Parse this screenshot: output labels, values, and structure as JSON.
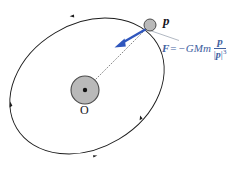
{
  "figure": {
    "background_color": "#ffffff"
  },
  "colors": {
    "orbit_stroke": "#1c1c1c",
    "central_body_fill": "#b9b9b9",
    "central_body_stroke": "#4a4a4a",
    "orbiting_body_fill": "#b9b9b9",
    "orbiting_body_stroke": "#4a4a4a",
    "force_arrow": "#2f56bd",
    "equation_text": "#41619f",
    "leader_line": "#8f9aa8",
    "radius_line": "#6b6b6b",
    "label_text": "#15151b"
  },
  "labels": {
    "orbiting_body": "p",
    "origin": "O"
  },
  "equation": {
    "force_symbol": "F",
    "equals": "=",
    "minus": "−",
    "constants": "GMm",
    "numerator": "p",
    "denominator_open": "|",
    "denominator_vector": "p",
    "denominator_close": "|",
    "denominator_exponent": "3",
    "full_text": "F = −GMm p/|p|³"
  },
  "geometry": {
    "orbit": {
      "shape": "ellipse",
      "center_x": 87,
      "center_y": 86,
      "radius_x": 82,
      "radius_y": 62,
      "rotation_deg": -31
    },
    "central_body": {
      "center_x": 85,
      "center_y": 90,
      "radius": 14,
      "core_dot_radius": 2.2
    },
    "orbiting_body": {
      "center_x": 150,
      "center_y": 25,
      "radius": 6
    },
    "radius_line": {
      "from_x": 85,
      "from_y": 90,
      "to_x": 150,
      "to_y": 25,
      "style": "dotted"
    },
    "force_arrow": {
      "from_x": 147,
      "from_y": 28,
      "to_x": 116,
      "to_y": 46
    },
    "orbit_direction_markers": [
      {
        "x": 72,
        "y": 16,
        "angle_deg": 200
      },
      {
        "x": 11,
        "y": 104,
        "angle_deg": 288
      },
      {
        "x": 95,
        "y": 156,
        "angle_deg": 18
      },
      {
        "x": 141,
        "y": 118,
        "angle_deg": 300
      }
    ],
    "leader_line": {
      "from_x": 152,
      "from_y": 31,
      "to_x": 178,
      "to_y": 40
    }
  }
}
